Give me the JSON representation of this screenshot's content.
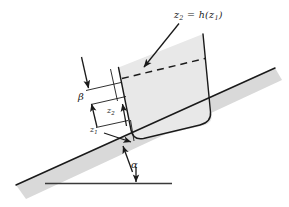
{
  "figure": {
    "labels": {
      "surface_equation_lhs": "z",
      "surface_equation_lhs_sub": "2",
      "surface_equation_eq": "=",
      "surface_equation_fn": "h",
      "surface_equation_open": "(",
      "surface_equation_arg": "z",
      "surface_equation_arg_sub": "1",
      "surface_equation_close": ")",
      "beta": "β",
      "alpha": "α",
      "z2": "z",
      "z2_sub": "2",
      "z1": "z",
      "z1_sub": "1"
    },
    "colors": {
      "line": "#1a1a1a",
      "slope_fill": "#d9d9d9",
      "vessel_fill": "#e8e8e8",
      "background": "#ffffff"
    },
    "geometry": {
      "incline_angle_label": "α",
      "offset_label": "β",
      "free_surface_style": "dashed"
    }
  }
}
